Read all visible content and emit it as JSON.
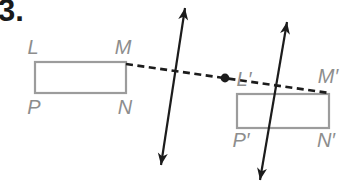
{
  "problem_number": "3.",
  "colors": {
    "background": "#ffffff",
    "figure_gray": "#9c9c9c",
    "label_gray": "#8d8d8d",
    "ink": "#1c1c1c"
  },
  "diagram": {
    "preimage": {
      "top_left": "L",
      "top_right": "M",
      "bottom_right": "N",
      "bottom_left": "P"
    },
    "image": {
      "point_on_segment": "L′",
      "top_right": "M′",
      "bottom_right": "N′",
      "bottom_left": "P′"
    }
  }
}
